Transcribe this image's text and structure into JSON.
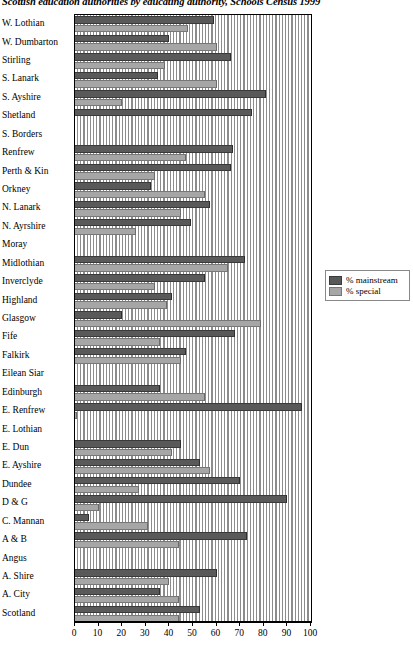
{
  "chart_data": {
    "type": "bar",
    "orientation": "horizontal",
    "title": "Scottish education authorities by educating authority, Schools Census 1999",
    "xlabel": "",
    "ylabel": "",
    "xlim": [
      0,
      100
    ],
    "xticks": [
      0,
      10,
      20,
      30,
      40,
      50,
      60,
      70,
      80,
      90,
      100
    ],
    "grid": true,
    "legend_position": "right",
    "categories": [
      "W. Lothian",
      "W. Dumbarton",
      "Stirling",
      "S. Lanark",
      "S. Ayshire",
      "Shetland",
      "S. Borders",
      "Renfrew",
      "Perth & Kin",
      "Orkney",
      "N. Lanark",
      "N. Ayrshire",
      "Moray",
      "Midlothian",
      "Inverclyde",
      "Highland",
      "Glasgow",
      "Fife",
      "Falkirk",
      "Eilean Siar",
      "Edinburgh",
      "E. Renfrew",
      "E. Lothian",
      "E. Dun",
      "E. Ayshire",
      "Dundee",
      "D & G",
      "C. Mannan",
      "A & B",
      "Angus",
      "A. Shire",
      "A. City",
      "Scotland"
    ],
    "series": [
      {
        "name": "% mainstream",
        "color": "#595959",
        "values": [
          59,
          40,
          66,
          35,
          81,
          75,
          0,
          67,
          66,
          32,
          57,
          49,
          0,
          72,
          55,
          41,
          20,
          68,
          47,
          0,
          36,
          96,
          0,
          45,
          53,
          70,
          90,
          6,
          73,
          0,
          60,
          36,
          53
        ]
      },
      {
        "name": "% special",
        "color": "#a6a6a6",
        "values": [
          48,
          60,
          38,
          60,
          20,
          0,
          0,
          47,
          34,
          55,
          45,
          26,
          0,
          65,
          34,
          39,
          79,
          36,
          45,
          0,
          55,
          1,
          0,
          41,
          57,
          27,
          10,
          31,
          44,
          0,
          40,
          44,
          44
        ]
      }
    ]
  },
  "legend": {
    "items": [
      {
        "label": "% mainstream",
        "swatch": "dark-gray-swatch"
      },
      {
        "label": "% special",
        "swatch": "light-gray-swatch"
      }
    ]
  }
}
